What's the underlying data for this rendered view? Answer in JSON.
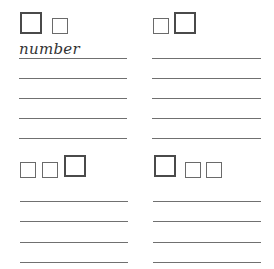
{
  "worksheet": {
    "panels": [
      {
        "id": "top-left",
        "boxes": [
          "big",
          "small"
        ],
        "label": "number",
        "answer_lines": 5
      },
      {
        "id": "top-right",
        "boxes": [
          "small",
          "big"
        ],
        "label": "",
        "answer_lines": 5
      },
      {
        "id": "bottom-left",
        "boxes": [
          "small",
          "small",
          "big"
        ],
        "label": "",
        "answer_lines": 4
      },
      {
        "id": "bottom-right",
        "boxes": [
          "big",
          "small",
          "small"
        ],
        "label": "",
        "answer_lines": 4
      }
    ]
  },
  "colors": {
    "big_box_border": "#4a4a4a",
    "small_box_border": "#6a6a6a",
    "line": "#707070",
    "text": "#333333",
    "background": "#ffffff"
  }
}
